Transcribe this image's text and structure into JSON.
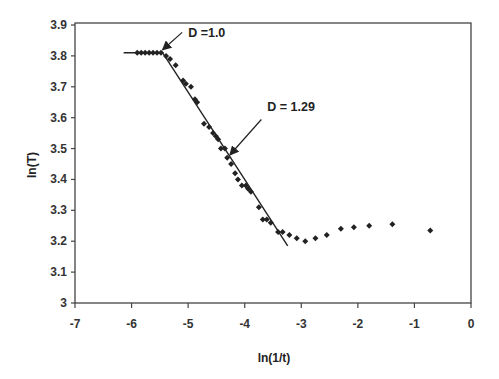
{
  "chart_data": {
    "type": "scatter",
    "title": "",
    "xlabel": "ln(1/t)",
    "ylabel": "ln(T)",
    "xlim": [
      -7,
      0
    ],
    "ylim": [
      3,
      3.9
    ],
    "grid": false,
    "legend": null,
    "x_ticks": [
      "-7",
      "-6",
      "-5",
      "-4",
      "-3",
      "-2",
      "-1",
      "0"
    ],
    "y_ticks": [
      "3",
      "3.1",
      "3.2",
      "3.3",
      "3.4",
      "3.5",
      "3.6",
      "3.7",
      "3.8",
      "3.9"
    ],
    "series": [
      {
        "name": "data",
        "marker": "diamond",
        "x": [
          -5.9,
          -5.83,
          -5.76,
          -5.69,
          -5.62,
          -5.55,
          -5.48,
          -5.39,
          -5.32,
          -5.22,
          -5.09,
          -5.04,
          -4.95,
          -4.88,
          -4.84,
          -4.72,
          -4.63,
          -4.56,
          -4.51,
          -4.47,
          -4.42,
          -4.35,
          -4.31,
          -4.24,
          -4.17,
          -4.12,
          -4.05,
          -3.98,
          -3.94,
          -3.89,
          -3.75,
          -3.68,
          -3.61,
          -3.54,
          -3.41,
          -3.33,
          -3.21,
          -3.08,
          -2.93,
          -2.75,
          -2.55,
          -2.3,
          -2.07,
          -1.8,
          -1.39,
          -0.72
        ],
        "y": [
          3.81,
          3.81,
          3.81,
          3.81,
          3.81,
          3.81,
          3.81,
          3.8,
          3.79,
          3.77,
          3.72,
          3.71,
          3.7,
          3.66,
          3.65,
          3.58,
          3.57,
          3.55,
          3.54,
          3.53,
          3.5,
          3.5,
          3.47,
          3.45,
          3.42,
          3.4,
          3.38,
          3.38,
          3.37,
          3.36,
          3.31,
          3.27,
          3.27,
          3.26,
          3.23,
          3.23,
          3.22,
          3.21,
          3.2,
          3.21,
          3.22,
          3.24,
          3.245,
          3.25,
          3.255,
          3.235
        ]
      }
    ],
    "fit_lines": [
      {
        "name": "D=1.0 fit",
        "x": [
          -6.14,
          -5.45
        ],
        "y": [
          3.81,
          3.81
        ]
      },
      {
        "name": "D=1.29 fit",
        "x": [
          -5.45,
          -3.24
        ],
        "y": [
          3.81,
          3.185
        ]
      }
    ],
    "annotations": [
      {
        "text": "D =1.0",
        "x": -5.0,
        "y": 3.86,
        "arrow_to": [
          -5.45,
          3.82
        ]
      },
      {
        "text": "D = 1.29",
        "x": -3.6,
        "y": 3.62,
        "arrow_to": [
          -4.26,
          3.48
        ]
      }
    ]
  }
}
